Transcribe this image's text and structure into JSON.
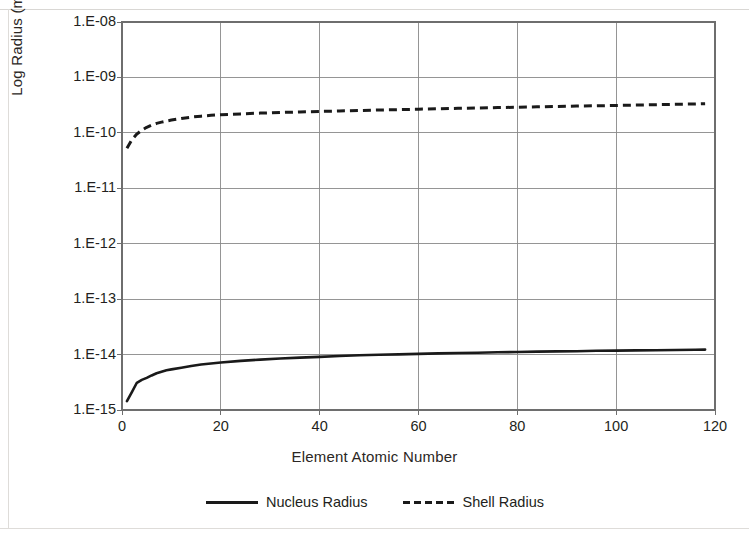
{
  "chart_data": {
    "type": "line",
    "title": "",
    "xlabel": "Element Atomic Number",
    "ylabel": "Log Radius (meters)",
    "xlim": [
      0,
      120
    ],
    "ylim": [
      1e-15,
      1e-08
    ],
    "yscale": "log",
    "grid": true,
    "legend_position": "bottom",
    "x_ticks": [
      0,
      20,
      40,
      60,
      80,
      100,
      120
    ],
    "x_tick_labels": [
      "0",
      "20",
      "40",
      "60",
      "80",
      "100",
      "120"
    ],
    "y_ticks": [
      1e-15,
      1e-14,
      1e-13,
      1e-12,
      1e-11,
      1e-10,
      1e-09,
      1e-08
    ],
    "y_tick_labels": [
      "1.E-15",
      "1.E-14",
      "1.E-13",
      "1.E-12",
      "1.E-11",
      "1.E-10",
      "1.E-09",
      "1.E-08"
    ],
    "x": [
      1,
      2,
      3,
      4,
      5,
      6,
      7,
      8,
      9,
      10,
      12,
      14,
      16,
      18,
      20,
      24,
      28,
      32,
      36,
      40,
      44,
      48,
      52,
      56,
      60,
      64,
      68,
      72,
      76,
      80,
      84,
      88,
      92,
      96,
      100,
      104,
      108,
      112,
      116,
      118
    ],
    "series": [
      {
        "name": "Nucleus Radius",
        "style": "solid",
        "color": "#1a1a1a",
        "values": [
          1.45e-15,
          2.1e-15,
          3.1e-15,
          3.5e-15,
          3.8e-15,
          4.2e-15,
          4.6e-15,
          4.9e-15,
          5.2e-15,
          5.4e-15,
          5.8e-15,
          6.2e-15,
          6.6e-15,
          6.9e-15,
          7.2e-15,
          7.7e-15,
          8.1e-15,
          8.5e-15,
          8.8e-15,
          9.1e-15,
          9.4e-15,
          9.7e-15,
          9.9e-15,
          1.01e-14,
          1.03e-14,
          1.05e-14,
          1.07e-14,
          1.08e-14,
          1.1e-14,
          1.11e-14,
          1.13e-14,
          1.14e-14,
          1.15e-14,
          1.17e-14,
          1.18e-14,
          1.19e-14,
          1.2e-14,
          1.21e-14,
          1.22e-14,
          1.23e-14
        ]
      },
      {
        "name": "Shell Radius",
        "style": "dashed",
        "color": "#1a1a1a",
        "values": [
          5.3e-11,
          7.5e-11,
          9.5e-11,
          1.12e-10,
          1.26e-10,
          1.38e-10,
          1.48e-10,
          1.56e-10,
          1.63e-10,
          1.7e-10,
          1.82e-10,
          1.92e-10,
          2e-10,
          2.07e-10,
          2.12e-10,
          2.2e-10,
          2.27e-10,
          2.33e-10,
          2.38e-10,
          2.43e-10,
          2.48e-10,
          2.53e-10,
          2.58e-10,
          2.62e-10,
          2.67e-10,
          2.72e-10,
          2.77e-10,
          2.81e-10,
          2.86e-10,
          2.9e-10,
          2.95e-10,
          3e-10,
          3.04e-10,
          3.08e-10,
          3.12e-10,
          3.17e-10,
          3.22e-10,
          3.27e-10,
          3.32e-10,
          3.36e-10
        ]
      }
    ]
  },
  "axis": {
    "y_title": "Log Radius (meters)",
    "x_title": "Element Atomic Number"
  },
  "legend": {
    "entries": [
      {
        "label": "Nucleus Radius"
      },
      {
        "label": "Shell Radius"
      }
    ]
  },
  "plot_box": {
    "left": 122,
    "right": 715,
    "top": 22,
    "bottom": 410
  },
  "colors": {
    "line": "#1a1a1a",
    "grid": "#8a8a8a",
    "frame": "#6e6e6e",
    "text": "#231f20",
    "background": "#ffffff"
  }
}
